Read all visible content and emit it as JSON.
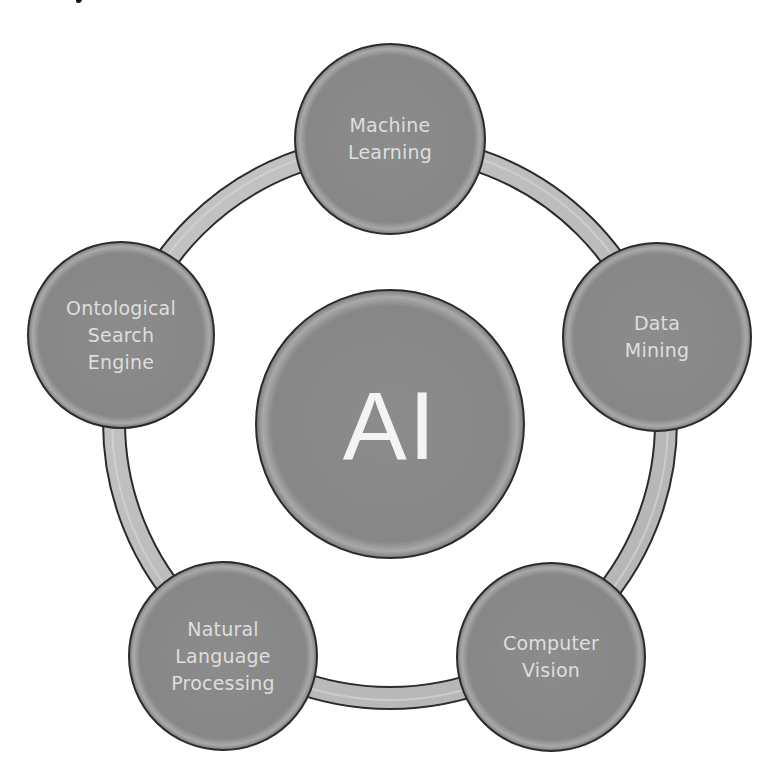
{
  "diagram": {
    "type": "hub-and-ring",
    "center": {
      "label": "AI"
    },
    "nodes": [
      {
        "label": "Machine\nLearning",
        "position": "top"
      },
      {
        "label": "Data\nMining",
        "position": "upper-right"
      },
      {
        "label": "Computer\nVision",
        "position": "lower-right"
      },
      {
        "label": "Natural\nLanguage\nProcessing",
        "position": "lower-left"
      },
      {
        "label": "Ontological\nSearch\nEngine",
        "position": "upper-left"
      }
    ],
    "colors": {
      "node_fill": "#8a8a8a",
      "node_outline": "#2b2b2b",
      "ring_fill": "#bcbcbc",
      "node_text": "#dedede",
      "center_text": "#f4f4f4"
    }
  }
}
